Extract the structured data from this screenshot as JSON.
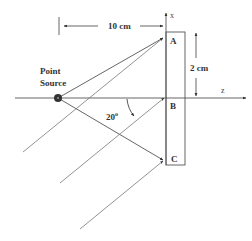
{
  "diagram": {
    "source_label_line1": "Point",
    "source_label_line2": "Source",
    "distance_label": "10 cm",
    "height_label": "2 cm",
    "angle_label": "20",
    "angle_unit": "o",
    "axis_x_label": "x",
    "axis_z_label": "z",
    "points": [
      {
        "id": "A",
        "label": "A"
      },
      {
        "id": "B",
        "label": "B"
      },
      {
        "id": "C",
        "label": "C"
      }
    ],
    "colors": {
      "line": "#555555",
      "source_fill": "#333333",
      "text": "#333333"
    }
  }
}
